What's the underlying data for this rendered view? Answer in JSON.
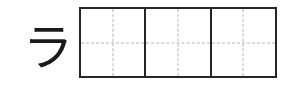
{
  "worksheet": {
    "script": "katakana",
    "model_character": "ラ",
    "model_character_romaji": "ra",
    "practice_cells": [
      {
        "content": ""
      },
      {
        "content": ""
      },
      {
        "content": ""
      }
    ],
    "colors": {
      "background": "#fefefe",
      "ink": "#1a1a1a",
      "cell_border": "#262626",
      "guide_line": "#b3b3b3"
    }
  }
}
